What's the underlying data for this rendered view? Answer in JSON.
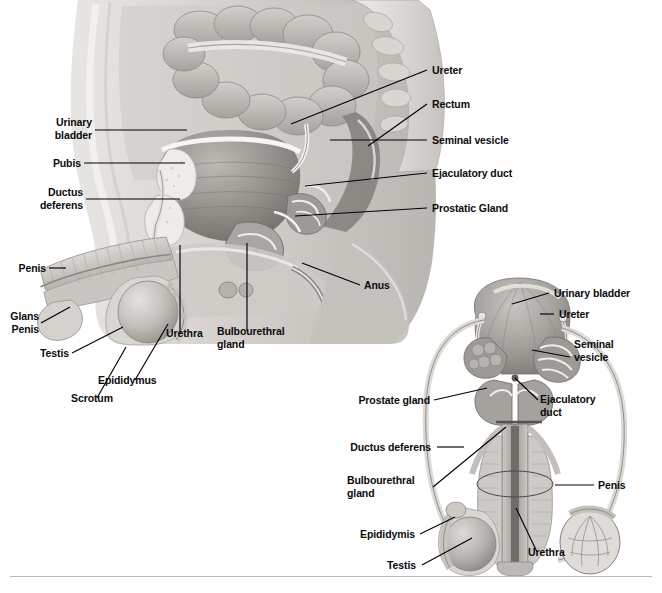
{
  "figure": {
    "background_color": "#ffffff",
    "label_color": "#0b0b0b",
    "leader_color": "#000000",
    "rule_color": "#b9b9b9",
    "width": 662,
    "height": 593
  },
  "sagittal_view": {
    "name": "Sagittal section of the male pelvis",
    "labels": {
      "urinary_bladder": "Urinary\nbladder",
      "pubis": "Pubis",
      "ductus_deferens": "Ductus\ndeferens",
      "penis": "Penis",
      "glans_penis": "Glans\nPenis",
      "testis": "Testis",
      "scrotum": "Scrotum",
      "epididymus": "Epididymus",
      "urethra": "Urethra",
      "bulbourethral_gland": "Bulbourethral\ngland",
      "anus": "Anus",
      "ureter": "Ureter",
      "rectum": "Rectum",
      "seminal_vesicle": "Seminal vesicle",
      "ejaculatory_duct": "Ejaculatory duct",
      "prostatic_gland": "Prostatic Gland"
    }
  },
  "anterior_view": {
    "name": "Anterior view of male reproductive organs",
    "labels": {
      "urinary_bladder": "Urinary bladder",
      "ureter": "Ureter",
      "seminal_vesicle": "Seminal\nvesicle",
      "ejaculatory_duct": "Ejaculatory\nduct",
      "prostate_gland": "Prostate gland",
      "ductus_deferens": "Ductus deferens",
      "bulbourethral_gland": "Bulbourethral\ngland",
      "epididymis": "Epididymis",
      "testis": "Testis",
      "penis": "Penis",
      "urethra": "Urethra"
    }
  }
}
